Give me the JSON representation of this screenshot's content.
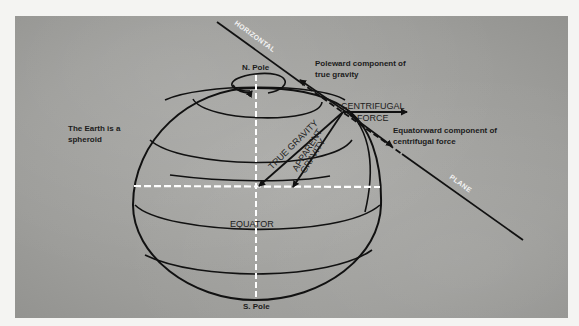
{
  "figure": {
    "caption_fragment": "",
    "labels": {
      "n_pole": "N. Pole",
      "s_pole": "S. Pole",
      "equator": "EQUATOR",
      "earth_note_line1": "The Earth is a",
      "earth_note_line2": "spheroid",
      "horizontal": "HORIZONTAL",
      "plane": "PLANE",
      "poleward_line1": "Poleward component of",
      "poleward_line2": "true gravity",
      "centrifugal_line1": "CENTRIFUGAL",
      "centrifugal_line2": "FORCE",
      "equatorward_line1": "Equatorward component of",
      "equatorward_line2": "centrifugal force",
      "true_gravity": "TRUE GRAVITY",
      "apparent_gravity_line1": "APPARENT",
      "apparent_gravity_line2": "GRAVITY"
    },
    "colors": {
      "background_photo": "#a0a09d",
      "line": "#111111",
      "axis_dashes": "#ffffff",
      "page": "#f4f4f2"
    }
  }
}
